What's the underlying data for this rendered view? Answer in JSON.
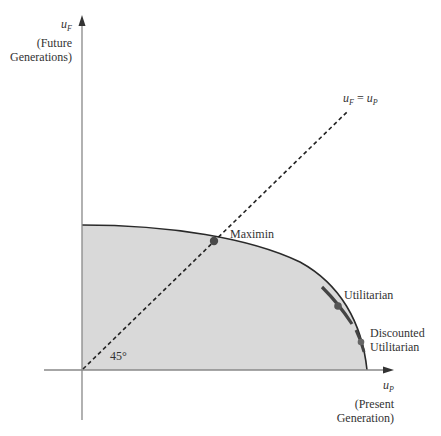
{
  "figure": {
    "type": "utility-possibility-frontier",
    "y_axis": {
      "symbol": "u",
      "subscript": "F",
      "label_line1": "(Future",
      "label_line2": "Generations)"
    },
    "x_axis": {
      "symbol": "u",
      "subscript": "P",
      "label_line1": "(Present",
      "label_line2": "Generation)"
    },
    "equality_line": {
      "lhs_symbol": "u",
      "lhs_sub": "F",
      "eq": "=",
      "rhs_symbol": "u",
      "rhs_sub": "P",
      "angle_label": "45°"
    },
    "points": [
      {
        "name": "maximin",
        "label": "Maximin"
      },
      {
        "name": "utilitarian",
        "label": "Utilitarian"
      },
      {
        "name": "discounted-utilitarian",
        "label_line1": "Discounted",
        "label_line2": "Utilitarian"
      }
    ],
    "colors": {
      "fill": "#d9d9d9",
      "frontier": "#2a2a2a",
      "axis": "#888888",
      "dot": "#555555",
      "dashed": "#222222"
    }
  }
}
